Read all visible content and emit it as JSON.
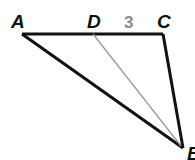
{
  "diagram": {
    "type": "triangle",
    "vertices": [
      {
        "label": "A",
        "x": 22,
        "y": 34
      },
      {
        "label": "D",
        "x": 93,
        "y": 34
      },
      {
        "label": "C",
        "x": 163,
        "y": 34
      },
      {
        "label": "B",
        "x": 183,
        "y": 148
      }
    ],
    "segments": [
      {
        "from": "A",
        "to": "C",
        "style": "thick"
      },
      {
        "from": "C",
        "to": "B",
        "style": "thick"
      },
      {
        "from": "A",
        "to": "B",
        "style": "thick"
      },
      {
        "from": "D",
        "to": "B",
        "style": "thin-gray"
      }
    ],
    "labels": {
      "A": "A",
      "D": "D",
      "C": "C",
      "B": "B",
      "dc_length": "3"
    },
    "colors": {
      "edge": "#111111",
      "segment_db": "#9a9a9a",
      "measure_text": "#8a8a8a"
    }
  }
}
